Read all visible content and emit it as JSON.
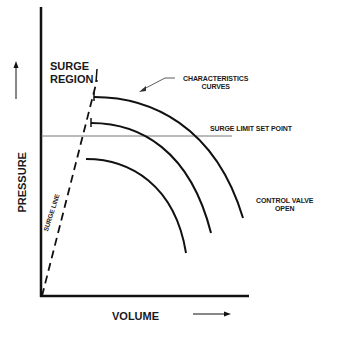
{
  "diagram": {
    "axes": {
      "y_label": "PRESSURE",
      "x_label": "VOLUME"
    },
    "labels": {
      "surge_region_line1": "SURGE",
      "surge_region_line2": "REGION",
      "characteristics_line1": "CHARACTERISTICS",
      "characteristics_line2": "CURVES",
      "surge_limit": "SURGE LIMIT SET POINT",
      "control_valve_line1": "CONTROL VALVE",
      "control_valve_line2": "OPEN",
      "surge_line": "SURGE LINE"
    },
    "curves": [
      {
        "name": "characteristic-curve-1",
        "start": [
          94,
          97
        ],
        "end": [
          243,
          218
        ]
      },
      {
        "name": "characteristic-curve-2",
        "start": [
          91,
          123
        ],
        "end": [
          211,
          233
        ]
      },
      {
        "name": "characteristic-curve-3",
        "start": [
          86,
          159
        ],
        "end": [
          186,
          253
        ]
      }
    ],
    "colors": {
      "line": "#111111",
      "thin_line": "#555555",
      "background": "#ffffff"
    }
  }
}
